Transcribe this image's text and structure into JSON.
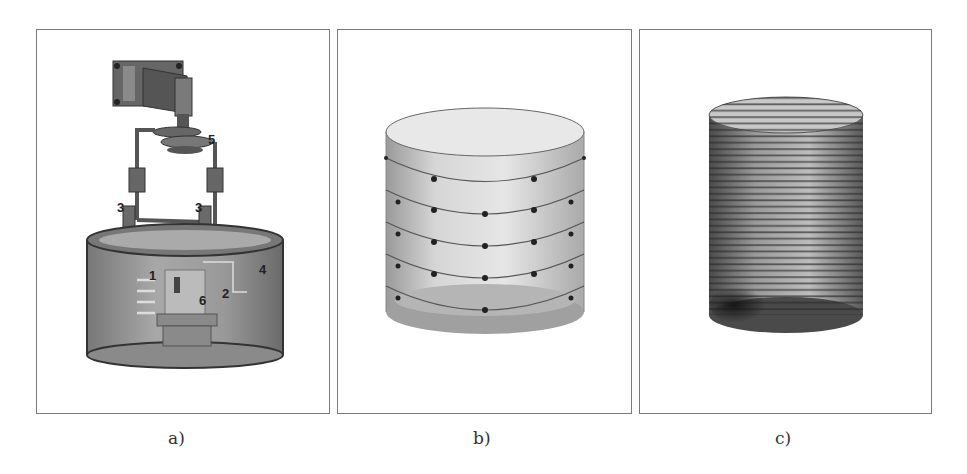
{
  "figure": {
    "panels": [
      {
        "id": "a",
        "caption": "a)",
        "description": "Experimental setup schematic: cylindrical tank with mounted motor/actuator assembly",
        "labels": [
          {
            "text": "1",
            "meaning": "component 1 (horizontal probe bars)"
          },
          {
            "text": "2",
            "meaning": "component 2"
          },
          {
            "text": "3",
            "meaning": "component 3 (left support)"
          },
          {
            "text": "3",
            "meaning": "component 3 (right support)"
          },
          {
            "text": "4",
            "meaning": "component 4 (tank wall)"
          },
          {
            "text": "5",
            "meaning": "component 5 (drive coupling)"
          },
          {
            "text": "6",
            "meaning": "component 6 (central sample holder)"
          }
        ]
      },
      {
        "id": "b",
        "caption": "b)",
        "description": "Cylinder with 5 horizontal rings of node points (coarse discretization)",
        "ring_count": 5
      },
      {
        "id": "c",
        "caption": "c)",
        "description": "Cylinder with dense horizontal rings of node points (fine discretization)",
        "ring_count": 34
      }
    ]
  },
  "colors": {
    "border": "#7a7a7a",
    "tank_dark": "#6e6e6e",
    "tank_mid": "#9a9a9a",
    "node": "#222222"
  }
}
